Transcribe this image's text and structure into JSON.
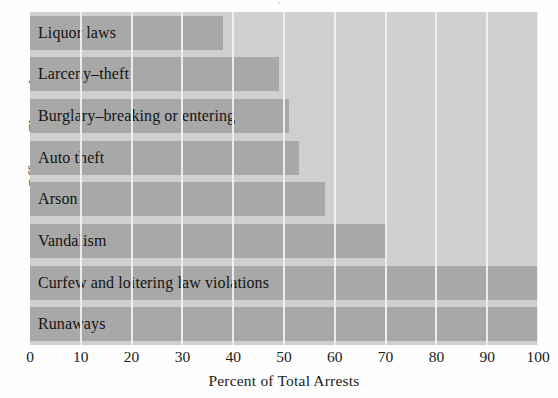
{
  "chart_data": {
    "type": "bar",
    "orientation": "horizontal",
    "title": "",
    "xlabel": "Percent of Total Arrests",
    "ylabel": "Offense Charged",
    "xlim": [
      0,
      100
    ],
    "xticks": [
      0,
      10,
      20,
      30,
      40,
      50,
      60,
      70,
      80,
      90,
      100
    ],
    "xtick_labels": [
      "0",
      "10",
      "20",
      "30",
      "40",
      "50",
      "60",
      "70",
      "80",
      "90",
      "100"
    ],
    "grid": "vertical-white-gridlines",
    "legend": "none",
    "categories": [
      "Liquor laws",
      "Larceny–theft",
      "Burglary–breaking or entering",
      "Auto theft",
      "Arson",
      "Vandalism",
      "Curfew and loitering law violations",
      "Runaways"
    ],
    "values": [
      38,
      49,
      51,
      53,
      58,
      70,
      100,
      100
    ],
    "colors": {
      "bar": "#a8a8a8",
      "plot_background": "#cfcfcf",
      "gridline": "#f2f2f2",
      "text": "#141414",
      "figure_background": "#fefefe"
    }
  },
  "axis": {
    "y_title": "Offense Charged",
    "x_title": "Percent of Total Arrests"
  },
  "title_remnant": "·"
}
